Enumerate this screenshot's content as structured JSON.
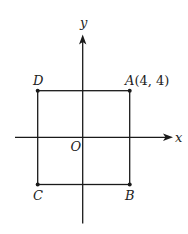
{
  "diagram": {
    "type": "coordinate-plane-square",
    "axes": {
      "x_label": "x",
      "y_label": "y",
      "origin_label": "O"
    },
    "points": [
      {
        "name": "A",
        "label": "A",
        "coords_label": "(4, 4)",
        "x": 4,
        "y": 4
      },
      {
        "name": "B",
        "label": "B",
        "x": 4,
        "y": -4
      },
      {
        "name": "C",
        "label": "C",
        "x": -4,
        "y": -4
      },
      {
        "name": "D",
        "label": "D",
        "x": -4,
        "y": 4
      }
    ],
    "shape": "square ABCD",
    "colors": {
      "line": "#1a1a1a",
      "background": "#ffffff"
    }
  }
}
